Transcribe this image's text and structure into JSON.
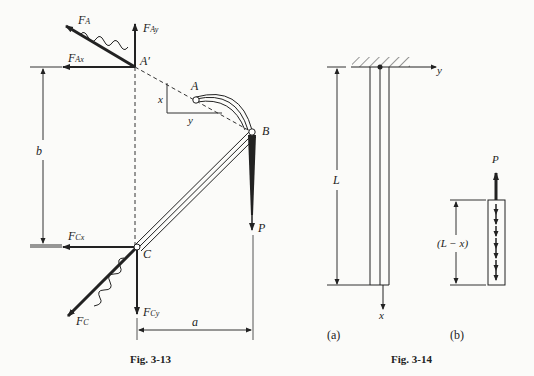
{
  "fig13": {
    "caption": "Fig. 3-13",
    "labels": {
      "FA": "F",
      "FA_sub": "A",
      "FAy": "F",
      "FAy_sub": "Ay",
      "FAx": "F",
      "FAx_sub": "Ax",
      "Aprime": "A′",
      "A": "A",
      "B": "B",
      "C": "C",
      "P": "P",
      "FCx": "F",
      "FCx_sub": "Cx",
      "FCy": "F",
      "FCy_sub": "Cy",
      "FC": "F",
      "FC_sub": "C",
      "b": "b",
      "a": "a",
      "x": "x",
      "y": "y"
    }
  },
  "fig14": {
    "caption": "Fig. 3-14",
    "part_a": {
      "tag": "(a)",
      "L": "L",
      "y_axis": "y",
      "x_axis": "x"
    },
    "part_b": {
      "tag": "(b)",
      "P": "P",
      "length": "(L − x)"
    }
  }
}
